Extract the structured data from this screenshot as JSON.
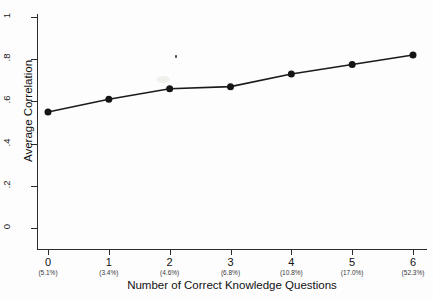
{
  "chart_data": {
    "type": "line",
    "title": "",
    "xlabel": "Number of Correct Knowledge Questions",
    "ylabel": "Average Correlation",
    "x": [
      0,
      1,
      2,
      3,
      4,
      5,
      6
    ],
    "values": [
      0.55,
      0.61,
      0.66,
      0.67,
      0.73,
      0.775,
      0.82
    ],
    "xtick_labels": [
      "0",
      "1",
      "2",
      "3",
      "4",
      "5",
      "6"
    ],
    "xtick_sublabels": [
      "(5.1%)",
      "(3.4%)",
      "(4.6%)",
      "(6.8%)",
      "(10.8%)",
      "(17.0%)",
      "(52.3%)"
    ],
    "ytick_labels": [
      "0",
      ".2",
      ".4",
      ".6",
      ".8",
      "1"
    ],
    "ytick_values": [
      0,
      0.2,
      0.4,
      0.6,
      0.8,
      1
    ],
    "xlim": [
      -0.18,
      6.18
    ],
    "ylim": [
      0,
      1.04
    ],
    "grid": false,
    "legend": null,
    "marker": "filled-circle",
    "series_color": "#1b1b1b"
  }
}
